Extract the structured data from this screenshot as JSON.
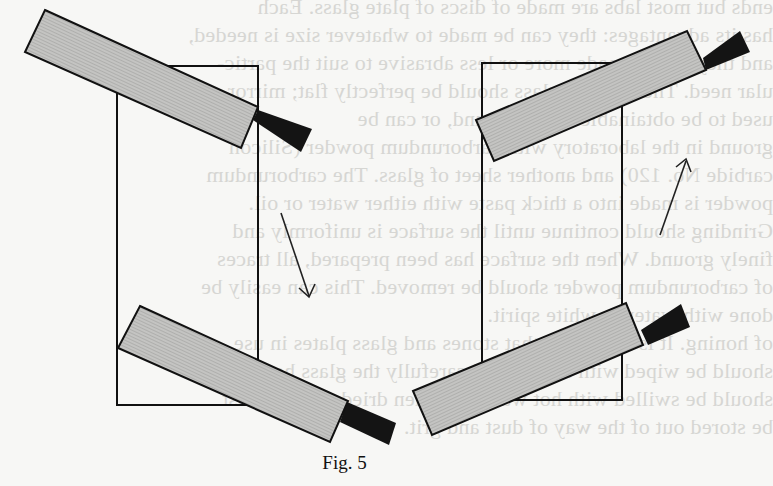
{
  "figure": {
    "caption": "Fig. 5",
    "colors": {
      "blade_fill": "#bdbdbb",
      "outline": "#111111",
      "handle": "#141414",
      "paper": "#f7f7f5",
      "showthrough_text": "#d6d6d3"
    },
    "panels": [
      {
        "name": "left",
        "sheet": {
          "x": 117,
          "y": 66,
          "w": 141,
          "h": 339
        },
        "arrow_direction": "down-right",
        "blades": [
          "top",
          "bottom"
        ]
      },
      {
        "name": "right",
        "sheet": {
          "x": 482,
          "y": 63,
          "w": 140,
          "h": 337
        },
        "arrow_direction": "up-right",
        "blades": [
          "top",
          "bottom"
        ]
      }
    ]
  },
  "showthrough": {
    "lines": [
      "ends but most labs are made of discs of plate glass. Each",
      "has its advantages: they can be made to whatever size is needed,",
      "and they can be made more or less abrasive to suit the partic-",
      "ular need. The sheet of glass should be perfectly flat; mirror glass",
      "used to be obtainable ready-ground, or can be",
      "ground in the laboratory with carborundum powder (Silicon",
      "carbide No. 120) and another sheet of glass. The carborundum",
      "powder is made into a thick paste with either water or oil.",
      "Grinding should continue until the surface is uniformly and",
      "finely ground. When the surface has been prepared, all traces",
      "of carborundum powder should be removed. This can easily be",
      "done with water or white spirit.",
      "of honing. It is important that stones and glass plates in use",
      "should be wiped with a cloth and carefully the glass hones",
      "should be swilled with hot water and then dried. Hones must",
      "be stored out of the way of dust and grit."
    ]
  }
}
